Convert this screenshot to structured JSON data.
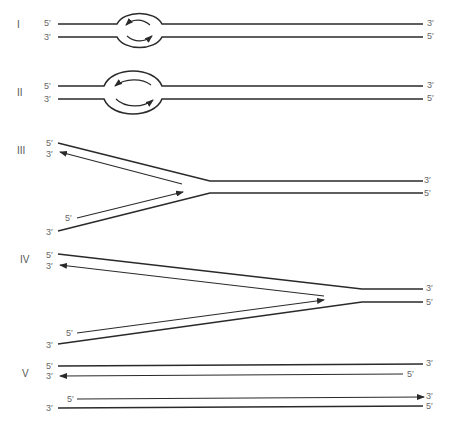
{
  "figure": {
    "stroke_color": "#2a2a2a",
    "label_color": "#666666"
  },
  "panels": [
    {
      "numeral": "I",
      "left_labels": {
        "top": "5′",
        "bottom": "3′"
      },
      "right_labels": {
        "top": "3′",
        "bottom": "5′"
      }
    },
    {
      "numeral": "II",
      "left_labels": {
        "top": "5′",
        "bottom": "3′"
      },
      "right_labels": {
        "top": "3′",
        "bottom": "5′"
      }
    },
    {
      "numeral": "III",
      "left_labels": {
        "top": "5′",
        "second": "3′",
        "nascent": "5′",
        "bottom": "3′"
      },
      "right_labels": {
        "top": "3′",
        "bottom": "5′"
      }
    },
    {
      "numeral": "IV",
      "left_labels": {
        "top": "5′",
        "second": "3′",
        "nascent": "5′",
        "bottom": "3′"
      },
      "right_labels": {
        "top": "3′",
        "bottom": "5′"
      }
    },
    {
      "numeral": "V",
      "left_labels": {
        "top": "5′",
        "second": "3′",
        "nascent": "5′",
        "bottom": "3′"
      },
      "right_labels": {
        "top": "3′",
        "second": "5′",
        "nascent": "3′",
        "bottom": "5′"
      }
    }
  ]
}
